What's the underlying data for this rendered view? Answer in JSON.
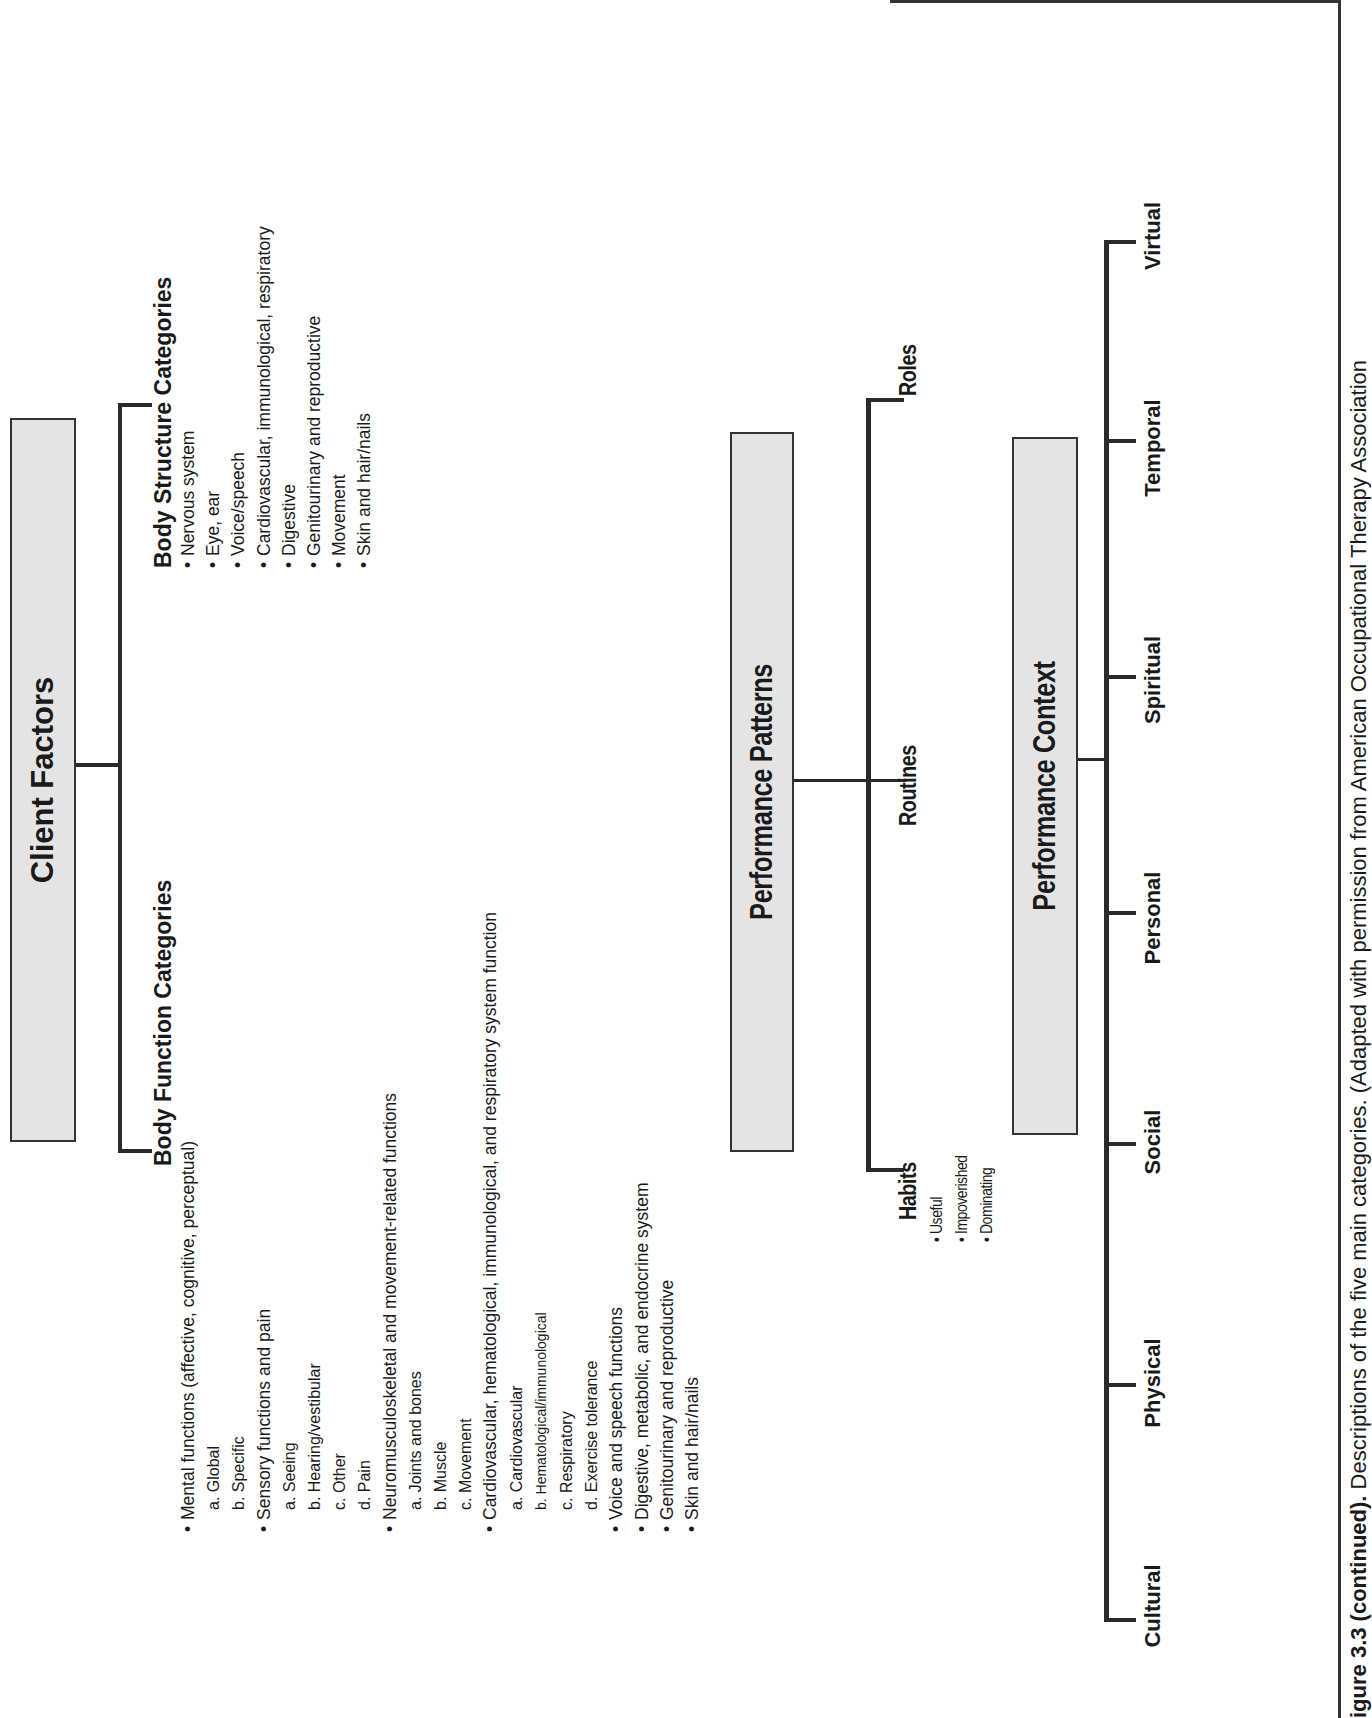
{
  "client_factors": {
    "title": "Client Factors",
    "body_function": {
      "heading": "Body Function Categories",
      "items": [
        {
          "text": "Mental functions (affective, cognitive, perceptual)",
          "level": 0
        },
        {
          "text": "a. Global",
          "level": 1
        },
        {
          "text": "b. Specific",
          "level": 1
        },
        {
          "text": "Sensory functions and pain",
          "level": 0
        },
        {
          "text": "a. Seeing",
          "level": 1
        },
        {
          "text": "b. Hearing/vestibular",
          "level": 1
        },
        {
          "text": "c. Other",
          "level": 1
        },
        {
          "text": "d. Pain",
          "level": 1
        },
        {
          "text": "Neuromusculoskeletal and movement-related functions",
          "level": 0
        },
        {
          "text": "a. Joints and bones",
          "level": 1
        },
        {
          "text": "b. Muscle",
          "level": 1
        },
        {
          "text": "c. Movement",
          "level": 1
        },
        {
          "text": "Cardiovascular, hematological, immunological, and respiratory system function",
          "level": 0
        },
        {
          "text": "a. Cardiovascular",
          "level": 1
        },
        {
          "text": "b. Hematological/immunological",
          "level": 1
        },
        {
          "text": "c. Respiratory",
          "level": 1
        },
        {
          "text": "d. Exercise tolerance",
          "level": 1
        },
        {
          "text": "Voice and speech functions",
          "level": 0
        },
        {
          "text": "Digestive, metabolic, and endocrine system",
          "level": 0
        },
        {
          "text": "Genitourinary and reproductive",
          "level": 0
        },
        {
          "text": "Skin and hair/nails",
          "level": 0
        }
      ]
    },
    "body_structure": {
      "heading": "Body Structure Categories",
      "items": [
        "Nervous system",
        "Eye, ear",
        "Voice/speech",
        "Cardiovascular, immunological, respiratory",
        "Digestive",
        "Genitourinary and reproductive",
        "Movement",
        "Skin and hair/nails"
      ]
    }
  },
  "performance_patterns": {
    "title": "Performance Patterns",
    "habits": {
      "label": "Habits",
      "items": [
        "Useful",
        "Impoverished",
        "Dominating"
      ]
    },
    "routines": {
      "label": "Routines"
    },
    "roles": {
      "label": "Roles"
    }
  },
  "performance_context": {
    "title": "Performance Context",
    "items": [
      "Cultural",
      "Physical",
      "Social",
      "Personal",
      "Spiritual",
      "Temporal",
      "Virtual"
    ]
  },
  "caption": {
    "label": "igure 3.3 (continued).",
    "text": "Descriptions of the five main categories. (Adapted with permission from American Occupational Therapy Association"
  },
  "bullet": "•"
}
